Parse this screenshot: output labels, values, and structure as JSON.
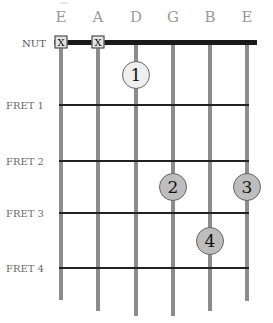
{
  "diagram": {
    "nut_label": "NUT",
    "strings": [
      {
        "name": "E",
        "x": 61,
        "end_y": 300
      },
      {
        "name": "A",
        "x": 98,
        "end_y": 311
      },
      {
        "name": "D",
        "x": 136,
        "end_y": 316
      },
      {
        "name": "G",
        "x": 173,
        "end_y": 316
      },
      {
        "name": "B",
        "x": 210,
        "end_y": 311
      },
      {
        "name": "E",
        "x": 247,
        "end_y": 301
      }
    ],
    "frets": [
      {
        "label": "FRET 1",
        "y": 105
      },
      {
        "label": "FRET 2",
        "y": 161
      },
      {
        "label": "FRET 3",
        "y": 213
      },
      {
        "label": "FRET 4",
        "y": 268
      }
    ],
    "muted": [
      {
        "string": "E",
        "mark": "X",
        "x": 61
      },
      {
        "string": "A",
        "mark": "X",
        "x": 98
      }
    ],
    "fingers": [
      {
        "finger": "1",
        "string": "D",
        "position": "between nut and fret 1",
        "x": 136,
        "y": 75,
        "style": "open"
      },
      {
        "finger": "2",
        "string": "G",
        "position": "fret 3",
        "x": 173,
        "y": 187,
        "style": "filled"
      },
      {
        "finger": "3",
        "string": "E",
        "position": "fret 3",
        "x": 247,
        "y": 187,
        "style": "filled"
      },
      {
        "finger": "4",
        "string": "B",
        "position": "fret 4",
        "x": 210,
        "y": 241,
        "style": "filled"
      }
    ],
    "colors": {
      "string": "#8c8c8c",
      "fret": "#222222",
      "nut": "#1a1a1a",
      "dot_open": "#efefef",
      "dot_filled": "#bdbdbd"
    }
  }
}
